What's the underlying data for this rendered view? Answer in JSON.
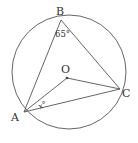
{
  "diagram": {
    "circle": {
      "cx": 69,
      "cy": 72,
      "r": 57
    },
    "points": {
      "A": {
        "label": "A",
        "x": 24,
        "y": 112
      },
      "B": {
        "label": "B",
        "x": 61,
        "y": 20
      },
      "C": {
        "label": "C",
        "x": 120,
        "y": 89
      },
      "O": {
        "label": "O",
        "x": 67,
        "y": 78
      }
    },
    "angles": {
      "B": "65°",
      "A": "x°"
    },
    "stroke_color": "#555555"
  }
}
